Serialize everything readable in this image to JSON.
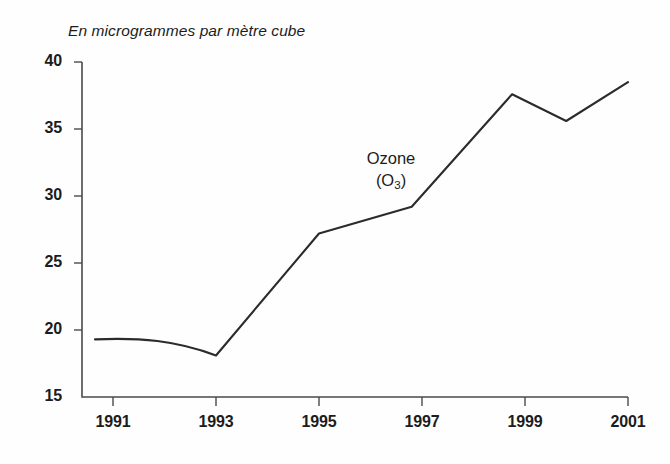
{
  "chart_data": {
    "type": "line",
    "title": "En microgrammes par mètre cube",
    "subtitle": "",
    "xlabel": "",
    "ylabel": "",
    "grid": false,
    "legend_position": "inline-annotation",
    "xlim": [
      1990.5,
      2001
    ],
    "ylim": [
      15,
      40
    ],
    "ytick_values": [
      15,
      20,
      25,
      30,
      35,
      40
    ],
    "ytick_labels": [
      "15",
      "20",
      "25",
      "30",
      "35",
      "40"
    ],
    "xtick_values": [
      1991,
      1993,
      1995,
      1997,
      1999,
      2001
    ],
    "xtick_labels": [
      "1991",
      "1993",
      "1995",
      "1997",
      "1999",
      "2001"
    ],
    "series": [
      {
        "name": "Ozone (O3)",
        "annotation_line1": "Ozone",
        "annotation_line2_prefix": "(O",
        "annotation_line2_sub": "3",
        "annotation_line2_suffix": ")",
        "color": "#2b2b2b",
        "x": [
          1990.65,
          1991,
          1992,
          1993,
          1995,
          1996.8,
          1998.75,
          1999.8,
          2001
        ],
        "values": [
          19.3,
          19.3,
          19.1,
          18.1,
          27.2,
          29.2,
          37.6,
          35.6,
          38.5
        ]
      }
    ]
  },
  "axes": {
    "y_ticks": [
      {
        "label": "40",
        "value": 40
      },
      {
        "label": "35",
        "value": 35
      },
      {
        "label": "30",
        "value": 30
      },
      {
        "label": "25",
        "value": 25
      },
      {
        "label": "20",
        "value": 20
      },
      {
        "label": "15",
        "value": 15
      }
    ],
    "x_ticks": [
      {
        "label": "1991",
        "value": 1991
      },
      {
        "label": "1993",
        "value": 1993
      },
      {
        "label": "1995",
        "value": 1995
      },
      {
        "label": "1997",
        "value": 1997
      },
      {
        "label": "1999",
        "value": 1999
      },
      {
        "label": "2001",
        "value": 2001
      }
    ]
  },
  "colors": {
    "line": "#2b2b2b",
    "axis": "#4a4a4a",
    "text": "#1c1c1c",
    "background": "#fefefe"
  }
}
